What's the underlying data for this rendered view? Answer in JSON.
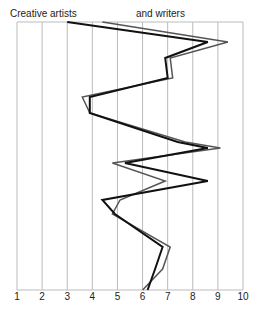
{
  "chart_data": {
    "type": "line",
    "orientation": "vertical-profile",
    "title": "",
    "legend": [
      "Creative artists",
      "and writers"
    ],
    "xlabel": "",
    "ylabel": "",
    "xlim": [
      1,
      10
    ],
    "x_ticks": [
      "1",
      "2",
      "3",
      "4",
      "5",
      "6",
      "7",
      "8",
      "9",
      "10"
    ],
    "grid": true,
    "rows": 14,
    "series": [
      {
        "name": "Creative artists",
        "color": "#111111",
        "width": 2,
        "values": [
          3.0,
          8.6,
          6.9,
          7.0,
          3.9,
          3.9,
          7.4,
          8.6,
          5.3,
          8.6,
          4.4,
          4.9,
          6.8,
          6.5,
          6.2
        ]
      },
      {
        "name": "and writers",
        "color": "#555555",
        "width": 1.5,
        "values": [
          4.4,
          9.4,
          7.1,
          7.2,
          3.6,
          3.9,
          7.7,
          9.1,
          4.8,
          6.9,
          5.1,
          4.8,
          7.1,
          6.8,
          6.0
        ]
      }
    ],
    "y_positions": [
      22,
      42,
      58,
      78,
      97,
      113,
      142,
      148,
      163,
      181,
      200,
      214,
      247,
      269,
      290
    ]
  },
  "labels": {
    "left": "Creative artists",
    "right": "and writers"
  }
}
